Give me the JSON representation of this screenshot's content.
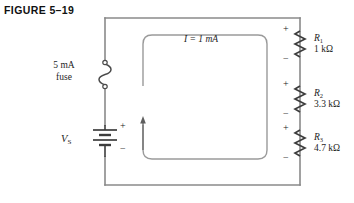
{
  "figure": {
    "title": "FIGURE 5–19",
    "type": "series-circuit-schematic"
  },
  "circuit": {
    "source": {
      "label": "V",
      "label_sub": "S",
      "symbol": "battery",
      "plus_sign": "+",
      "minus_sign": "−"
    },
    "fuse": {
      "rating": "5 mA",
      "word": "fuse",
      "symbol": "fuse"
    },
    "current": {
      "annotation": "I = 1 mA",
      "symbol": "I",
      "value": "1",
      "unit": "mA",
      "direction": "counterclockwise-arrow-up"
    },
    "resistors": [
      {
        "name": "R",
        "sub": "1",
        "value": "1 kΩ",
        "plus_sign": "+",
        "minus_sign": "−"
      },
      {
        "name": "R",
        "sub": "2",
        "value": "3.3 kΩ",
        "plus_sign": "+",
        "minus_sign": "−"
      },
      {
        "name": "R",
        "sub": "3",
        "value": "4.7 kΩ",
        "plus_sign": "+",
        "minus_sign": "−"
      }
    ],
    "colors": {
      "wire": "#8a8a8a",
      "component": "#4a4a4a",
      "text": "#1d1d1d",
      "inner_loop": "#9a9a9a",
      "background": "#ffffff"
    }
  }
}
